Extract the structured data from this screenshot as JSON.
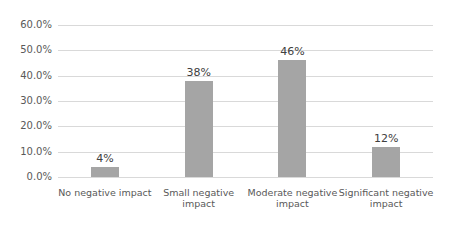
{
  "chart_data": {
    "type": "bar",
    "title": "",
    "xlabel": "",
    "ylabel": "",
    "categories": [
      "No negative impact",
      "Small negative impact",
      "Moderate negative impact",
      "Significant negative impact"
    ],
    "values": [
      4,
      38,
      46,
      12
    ],
    "data_labels": [
      "4%",
      "38%",
      "46%",
      "12%"
    ],
    "y_ticks": [
      "60.0%",
      "50.0%",
      "40.0%",
      "30.0%",
      "20.0%",
      "10.0%",
      "0.0%"
    ],
    "ylim": [
      0,
      60
    ],
    "grid": true,
    "legend": "none",
    "bar_color": "#a5a5a5"
  }
}
